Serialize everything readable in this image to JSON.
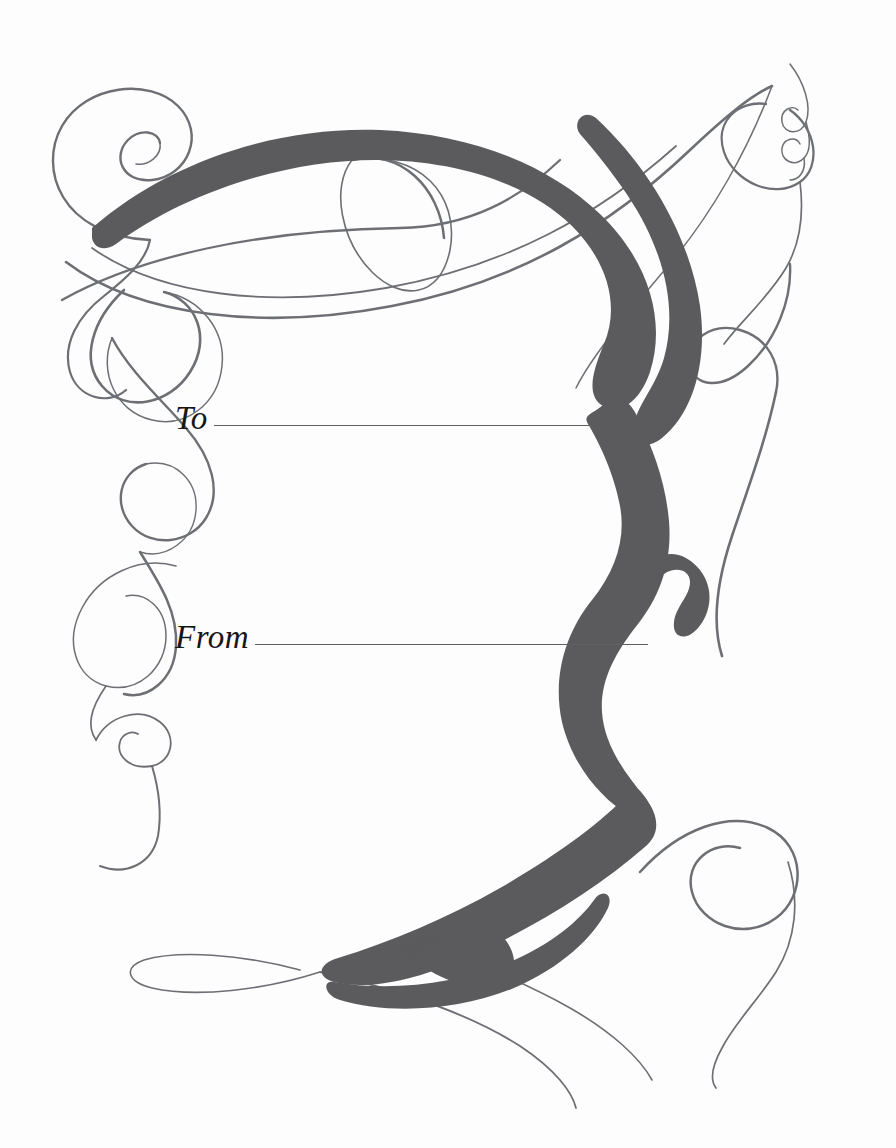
{
  "page": {
    "background_color": "#fdfdfd",
    "width": 896,
    "height": 1148
  },
  "artwork": {
    "name": "calligraphic-flourish-ribbon",
    "ribbon_color": "#5b5b5d",
    "hairline_color": "#6d6f74",
    "description": "Ornamental calligraphic ribbon with spiral flourishes"
  },
  "fields": [
    {
      "id": "to",
      "label": "To",
      "value": "",
      "placeholder": "",
      "rule_color": "#5e6064"
    },
    {
      "id": "from",
      "label": "From",
      "value": "",
      "placeholder": "",
      "rule_color": "#5e6064"
    }
  ]
}
